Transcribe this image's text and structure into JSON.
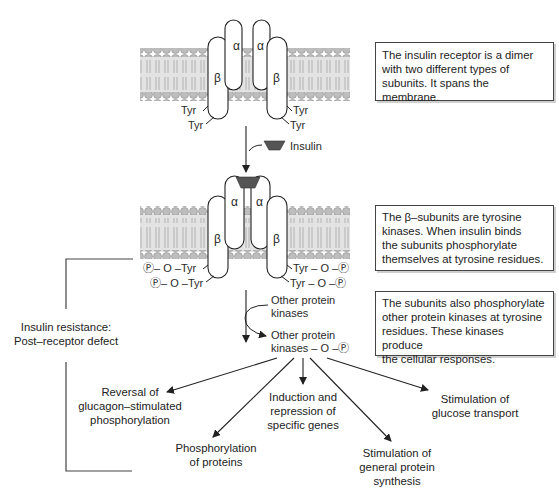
{
  "colors": {
    "membrane_fill": "#d9d9d9",
    "phospholipid_head": "#bdbdbd",
    "line": "#333333",
    "insulin": "#555555",
    "box_border": "#444444"
  },
  "receptor": {
    "alpha_label": "α",
    "beta_label": "β",
    "tyr_label": "Tyr",
    "phospho_tyr_left": "Ⓟ– O –Tyr",
    "phospho_tyr_right": "Tyr – O –Ⓟ"
  },
  "insulin_label": "Insulin",
  "kinases": {
    "inactive": [
      "Other protein",
      "kinases"
    ],
    "active": [
      "Other protein",
      "kinases – O –Ⓟ"
    ]
  },
  "info_boxes": [
    {
      "text": [
        "The insulin receptor is a dimer",
        "with two different types of",
        "subunits. It spans the membrane."
      ]
    },
    {
      "text": [
        "The β–subunits are tyrosine",
        "kinases. When insulin binds",
        "the subunits phosphorylate",
        "themselves at tyrosine residues."
      ]
    },
    {
      "text": [
        "The subunits also phosphorylate",
        "other protein kinases at tyrosine",
        "residues. These kinases produce",
        "the cellular responses."
      ]
    }
  ],
  "insulin_resistance": [
    "Insulin resistance:",
    "Post–receptor defect"
  ],
  "outcomes": [
    {
      "text": [
        "Reversal of",
        "glucagon–stimulated",
        "phosphorylation"
      ]
    },
    {
      "text": [
        "Phosphorylation",
        "of proteins"
      ]
    },
    {
      "text": [
        "Induction and",
        "repression of",
        "specific genes"
      ]
    },
    {
      "text": [
        "Stimulation of",
        "general protein",
        "synthesis"
      ]
    },
    {
      "text": [
        "Stimulation of",
        "glucose transport"
      ]
    }
  ]
}
